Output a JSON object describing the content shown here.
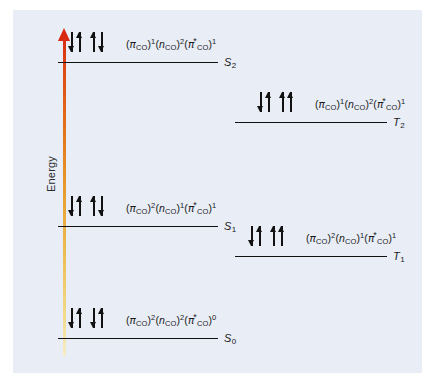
{
  "figure": {
    "name": "jablonski-electron-configuration-diagram",
    "background_color": "#e8edf6",
    "page_background_color": "#ffffff"
  },
  "axis": {
    "label": "Energy",
    "direction": "up",
    "gradient_top_color": "#d92b14",
    "gradient_bottom_color": "#f7ecc9",
    "arrowhead_color": "#d9260f"
  },
  "orbitals": {
    "pi": "π",
    "n": "n",
    "subscript": "CO",
    "star": "*"
  },
  "levels": [
    {
      "id": "S2",
      "term": "S",
      "term_subscript": "2",
      "column": "singlet",
      "spins": [
        [
          "down",
          "up"
        ],
        [
          "up",
          "down"
        ]
      ],
      "configuration": {
        "pi_occupancy": "1",
        "n_occupancy": "2",
        "pi_star_occupancy": "1",
        "text": "(πCO)1(nCO)2(π*CO)1"
      }
    },
    {
      "id": "T2",
      "term": "T",
      "term_subscript": "2",
      "column": "triplet",
      "spins": [
        [
          "down",
          "up"
        ],
        [
          "up",
          "up"
        ]
      ],
      "configuration": {
        "pi_occupancy": "1",
        "n_occupancy": "2",
        "pi_star_occupancy": "1",
        "text": "(πCO)1(nCO)2(π*CO)1"
      }
    },
    {
      "id": "S1",
      "term": "S",
      "term_subscript": "1",
      "column": "singlet",
      "spins": [
        [
          "down",
          "up"
        ],
        [
          "up",
          "down"
        ]
      ],
      "configuration": {
        "pi_occupancy": "2",
        "n_occupancy": "1",
        "pi_star_occupancy": "1",
        "text": "(πCO)2(nCO)1(π*CO)1"
      }
    },
    {
      "id": "T1",
      "term": "T",
      "term_subscript": "1",
      "column": "triplet",
      "spins": [
        [
          "down",
          "up"
        ],
        [
          "up",
          "up"
        ]
      ],
      "configuration": {
        "pi_occupancy": "2",
        "n_occupancy": "1",
        "pi_star_occupancy": "1",
        "text": "(πCO)2(nCO)1(π*CO)1"
      }
    },
    {
      "id": "S0",
      "term": "S",
      "term_subscript": "0",
      "column": "singlet",
      "spins": [
        [
          "down",
          "up"
        ],
        [
          "down",
          "up"
        ]
      ],
      "configuration": {
        "pi_occupancy": "2",
        "n_occupancy": "2",
        "pi_star_occupancy": "0",
        "text": "(πCO)2(nCO)2(π*CO)0"
      }
    }
  ]
}
